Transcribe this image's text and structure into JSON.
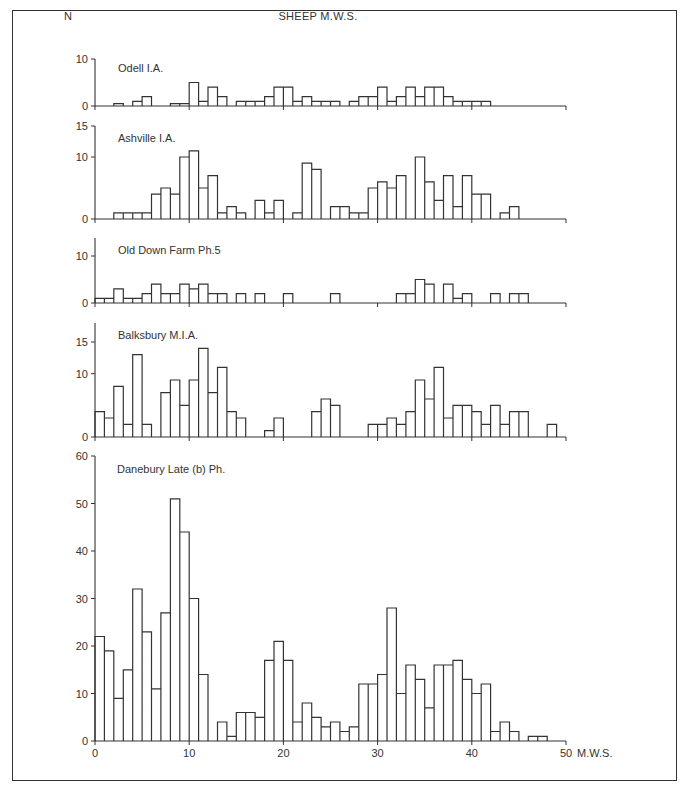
{
  "chart_data": {
    "type": "bar",
    "subtype": "histogram-step",
    "title": "SHEEP M.W.S.",
    "ylabel": "N",
    "xlabel": "M.W.S.",
    "x_ticks": [
      0,
      10,
      20,
      30,
      40,
      50
    ],
    "xlim": [
      0,
      50
    ],
    "bin_width": 1,
    "panels": [
      {
        "name": "Odell I.A.",
        "ylim": [
          0,
          10
        ],
        "y_ticks": [
          0,
          10
        ],
        "x": [
          2,
          4,
          5,
          8,
          9,
          10,
          11,
          12,
          13,
          15,
          16,
          17,
          18,
          19,
          20,
          21,
          22,
          23,
          24,
          25,
          27,
          28,
          29,
          30,
          31,
          32,
          33,
          34,
          35,
          36,
          37,
          38,
          39,
          40,
          41,
          42,
          43
        ],
        "values": [
          0.5,
          1,
          2,
          0.5,
          0.5,
          5,
          1,
          4,
          2,
          1,
          1,
          1,
          2,
          4,
          4,
          1,
          2,
          1,
          1,
          1,
          1,
          2,
          2,
          4,
          1,
          2,
          4,
          2,
          4,
          4,
          2,
          1,
          1,
          1,
          1,
          0,
          0
        ]
      },
      {
        "name": "Ashville I.A.",
        "ylim": [
          0,
          15
        ],
        "y_ticks": [
          0,
          10,
          15
        ],
        "x": [
          2,
          3,
          4,
          5,
          6,
          7,
          8,
          9,
          10,
          11,
          12,
          13,
          14,
          15,
          16,
          17,
          18,
          19,
          20,
          21,
          22,
          23,
          24,
          25,
          26,
          27,
          28,
          29,
          30,
          31,
          32,
          33,
          34,
          35,
          36,
          37,
          38,
          39,
          40,
          41,
          42,
          43,
          44,
          45
        ],
        "values": [
          1,
          1,
          1,
          1,
          4,
          5,
          4,
          10,
          11,
          5,
          7,
          1,
          2,
          1,
          0,
          3,
          1,
          3,
          0,
          1,
          9,
          8,
          0,
          2,
          2,
          1,
          1,
          5,
          6,
          5,
          7,
          0,
          10,
          6,
          3,
          7,
          2,
          7,
          4,
          4,
          0,
          1,
          2,
          0
        ]
      },
      {
        "name": "Old Down Farm Ph.5",
        "ylim": [
          0,
          10
        ],
        "y_ticks": [
          0,
          10
        ],
        "x": [
          0,
          1,
          2,
          3,
          4,
          5,
          6,
          7,
          8,
          9,
          10,
          11,
          12,
          13,
          14,
          15,
          16,
          17,
          18,
          19,
          20,
          21,
          22,
          23,
          24,
          25,
          26,
          27,
          28,
          29,
          30,
          31,
          32,
          33,
          34,
          35,
          36,
          37,
          38,
          39,
          40,
          41,
          42,
          43,
          44,
          45
        ],
        "values": [
          1,
          1,
          3,
          1,
          1,
          2,
          4,
          2,
          2,
          4,
          3,
          4,
          2,
          2,
          0,
          2,
          0,
          2,
          0,
          0,
          2,
          0,
          0,
          0,
          0,
          2,
          0,
          0,
          0,
          0,
          0,
          0,
          2,
          2,
          5,
          4,
          0,
          4,
          1,
          2,
          0,
          0,
          2,
          0,
          2,
          2
        ]
      },
      {
        "name": "Balksbury M.I.A.",
        "ylim": [
          0,
          15
        ],
        "y_ticks": [
          0,
          10,
          15
        ],
        "x": [
          0,
          1,
          2,
          3,
          4,
          5,
          6,
          7,
          8,
          9,
          10,
          11,
          12,
          13,
          14,
          15,
          16,
          17,
          18,
          19,
          20,
          21,
          22,
          23,
          24,
          25,
          26,
          27,
          28,
          29,
          30,
          31,
          32,
          33,
          34,
          35,
          36,
          37,
          38,
          39,
          40,
          41,
          42,
          43,
          44,
          45,
          46,
          47,
          48
        ],
        "values": [
          4,
          3,
          8,
          2,
          13,
          2,
          0,
          7,
          9,
          5,
          9,
          14,
          7,
          11,
          4,
          3,
          0,
          0,
          1,
          3,
          0,
          0,
          0,
          4,
          6,
          5,
          0,
          0,
          0,
          2,
          2,
          3,
          2,
          4,
          9,
          6,
          11,
          3,
          5,
          5,
          4,
          2,
          5,
          2,
          4,
          4,
          0,
          0,
          2
        ]
      },
      {
        "name": "Danebury Late (b) Ph.",
        "ylim": [
          0,
          60
        ],
        "y_ticks": [
          0,
          10,
          20,
          30,
          40,
          50,
          60
        ],
        "x": [
          0,
          1,
          2,
          3,
          4,
          5,
          6,
          7,
          8,
          9,
          10,
          11,
          12,
          13,
          14,
          15,
          16,
          17,
          18,
          19,
          20,
          21,
          22,
          23,
          24,
          25,
          26,
          27,
          28,
          29,
          30,
          31,
          32,
          33,
          34,
          35,
          36,
          37,
          38,
          39,
          40,
          41,
          42,
          43,
          44,
          45,
          46,
          47
        ],
        "values": [
          22,
          19,
          9,
          15,
          32,
          23,
          11,
          27,
          51,
          44,
          30,
          14,
          0,
          4,
          1,
          6,
          6,
          5,
          17,
          21,
          17,
          4,
          8,
          5,
          3,
          4,
          2,
          3,
          12,
          12,
          14,
          28,
          10,
          16,
          13,
          7,
          16,
          16,
          17,
          13,
          10,
          12,
          2,
          4,
          2,
          0,
          1,
          1
        ]
      }
    ]
  },
  "layout": {
    "x0_px": 95,
    "px_per_unit": 9.42,
    "panels_px": [
      {
        "base": 106,
        "top_val_px": 59,
        "top_val": 10,
        "axis_top": 59
      },
      {
        "base": 219,
        "top_val_px": 126,
        "top_val": 15,
        "axis_top": 126
      },
      {
        "base": 303,
        "top_val_px": 256,
        "top_val": 10,
        "axis_top": 238
      },
      {
        "base": 437,
        "top_val_px": 342,
        "top_val": 15,
        "axis_top": 323
      },
      {
        "base": 741,
        "top_val_px": 456,
        "top_val": 60,
        "axis_top": 456
      }
    ]
  },
  "labels": {
    "title": "SHEEP M.W.S.",
    "y_axis": "N",
    "x_axis": "M.W.S."
  }
}
